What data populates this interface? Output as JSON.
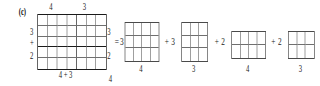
{
  "figure": {
    "part_label": "(c)"
  },
  "main_diagram": {
    "top_labels": {
      "left": "4",
      "right": "3"
    },
    "left_labels": {
      "top": "3",
      "operator": "+",
      "bottom": "2"
    },
    "right_labels": {
      "top": "3",
      "bottom": "2"
    },
    "bottom_label": "4 + 3",
    "stray_label": "4",
    "columns_total": 7,
    "rows_total": 5,
    "column_split_after": 4,
    "row_split_after": 3
  },
  "equals_sign": "=",
  "terms": [
    {
      "coefficient": "3",
      "operator": "",
      "grid": {
        "cols": 4,
        "rows": 3
      },
      "bottom_label": "4"
    },
    {
      "coefficient": "3",
      "operator": "+",
      "grid": {
        "cols": 3,
        "rows": 3
      },
      "bottom_label": "3"
    },
    {
      "coefficient": "2",
      "operator": "+",
      "grid": {
        "cols": 4,
        "rows": 2
      },
      "bottom_label": "4"
    },
    {
      "coefficient": "2",
      "operator": "+",
      "grid": {
        "cols": 3,
        "rows": 2
      },
      "bottom_label": "3"
    }
  ],
  "colors": {
    "ink": "#1a1a1a",
    "grid_line": "#6f6f6f",
    "small_grid_line": "#4a4a4a",
    "background": "#ffffff"
  }
}
